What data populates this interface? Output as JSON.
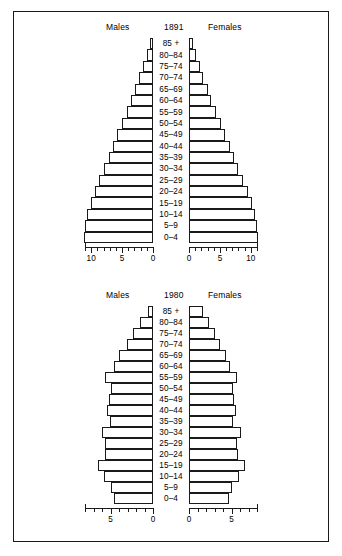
{
  "figure": {
    "background_color": "#ffffff",
    "line_color": "#1a1a1a"
  },
  "pyramids": [
    {
      "id": "pyramid-1891",
      "year": "1891",
      "males_label": "Males",
      "females_label": "Females",
      "axis": {
        "max": 11,
        "tick_interval": 1,
        "labeled_ticks": [
          "0",
          "5",
          "10"
        ],
        "labeled_values": [
          0,
          5,
          10
        ]
      }
    },
    {
      "id": "pyramid-1980",
      "year": "1980",
      "males_label": "Males",
      "females_label": "Females",
      "axis": {
        "max": 8,
        "tick_interval": 1,
        "labeled_ticks": [
          "0",
          "5"
        ],
        "labeled_values": [
          0,
          5
        ]
      }
    }
  ],
  "chart_data": [
    {
      "type": "bar",
      "title": "1891",
      "subtitle": "Population pyramid",
      "orientation": "horizontal-diverging",
      "xlabel": "",
      "ylabel": "",
      "xlim": [
        0,
        11
      ],
      "grid": false,
      "legend_position": "top",
      "categories": [
        "85 +",
        "80–84",
        "75–74",
        "70–74",
        "65–69",
        "60–64",
        "55–59",
        "50–54",
        "45–49",
        "40–44",
        "35–39",
        "30–34",
        "25–29",
        "20–24",
        "15–19",
        "10–14",
        "5–9",
        "0–4"
      ],
      "series": [
        {
          "name": "Males",
          "side": "left",
          "values": [
            0.5,
            1.0,
            1.6,
            2.2,
            2.9,
            3.5,
            4.2,
            5.0,
            5.8,
            6.5,
            7.2,
            7.9,
            8.7,
            9.4,
            10.1,
            10.6,
            11.0,
            11.1
          ]
        },
        {
          "name": "Females",
          "side": "right",
          "values": [
            0.6,
            1.1,
            1.7,
            2.3,
            3.0,
            3.6,
            4.3,
            5.1,
            5.9,
            6.6,
            7.3,
            8.0,
            8.8,
            9.5,
            10.2,
            10.7,
            11.0,
            11.1
          ]
        }
      ]
    },
    {
      "type": "bar",
      "title": "1980",
      "subtitle": "Population pyramid",
      "orientation": "horizontal-diverging",
      "xlabel": "",
      "ylabel": "",
      "xlim": [
        0,
        8
      ],
      "grid": false,
      "legend_position": "top",
      "categories": [
        "85 +",
        "80–84",
        "75–74",
        "70–74",
        "65–69",
        "60–64",
        "55–59",
        "50–54",
        "45–49",
        "40–44",
        "35–39",
        "30–34",
        "25–29",
        "20–24",
        "15–19",
        "10–14",
        "5–9",
        "0–4"
      ],
      "series": [
        {
          "name": "Males",
          "side": "left",
          "values": [
            0.6,
            1.5,
            2.3,
            3.1,
            4.0,
            4.6,
            5.6,
            5.0,
            5.2,
            5.4,
            5.1,
            6.0,
            5.6,
            5.7,
            6.5,
            5.8,
            4.9,
            4.6
          ]
        },
        {
          "name": "Females",
          "side": "right",
          "values": [
            1.7,
            2.4,
            3.0,
            3.6,
            4.4,
            4.8,
            5.7,
            5.2,
            5.3,
            5.5,
            5.2,
            6.1,
            5.7,
            5.8,
            6.6,
            5.9,
            5.0,
            4.7
          ]
        }
      ]
    }
  ]
}
